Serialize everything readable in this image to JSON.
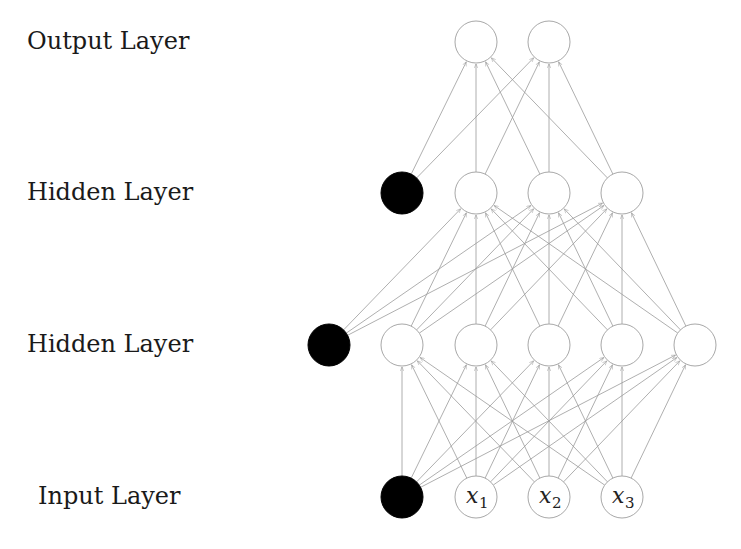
{
  "labels": {
    "output": "Output Layer",
    "hidden2": "Hidden Layer",
    "hidden1": "Hidden Layer",
    "input": "Input Layer"
  },
  "colors": {
    "edge": "#9a9a9a",
    "node_stroke": "#a8a8a8",
    "node_fill": "#ffffff",
    "bias_fill": "#000000",
    "text": "#1a1a1a"
  },
  "network": {
    "node_radius": 21,
    "layers": [
      {
        "name": "input",
        "y": 497,
        "nodes": [
          {
            "id": "in-bias",
            "x": 402,
            "bias": true,
            "label": "",
            "sub": ""
          },
          {
            "id": "x1",
            "x": 476,
            "bias": false,
            "label": "x",
            "sub": "1"
          },
          {
            "id": "x2",
            "x": 549,
            "bias": false,
            "label": "x",
            "sub": "2"
          },
          {
            "id": "x3",
            "x": 622,
            "bias": false,
            "label": "x",
            "sub": "3"
          }
        ]
      },
      {
        "name": "hidden1",
        "y": 345,
        "nodes": [
          {
            "id": "h1-bias",
            "x": 329,
            "bias": true,
            "label": "",
            "sub": ""
          },
          {
            "id": "h1-1",
            "x": 402,
            "bias": false,
            "label": "",
            "sub": ""
          },
          {
            "id": "h1-2",
            "x": 476,
            "bias": false,
            "label": "",
            "sub": ""
          },
          {
            "id": "h1-3",
            "x": 549,
            "bias": false,
            "label": "",
            "sub": ""
          },
          {
            "id": "h1-4",
            "x": 622,
            "bias": false,
            "label": "",
            "sub": ""
          },
          {
            "id": "h1-5",
            "x": 695,
            "bias": false,
            "label": "",
            "sub": ""
          }
        ]
      },
      {
        "name": "hidden2",
        "y": 193,
        "nodes": [
          {
            "id": "h2-bias",
            "x": 402,
            "bias": true,
            "label": "",
            "sub": ""
          },
          {
            "id": "h2-1",
            "x": 476,
            "bias": false,
            "label": "",
            "sub": ""
          },
          {
            "id": "h2-2",
            "x": 549,
            "bias": false,
            "label": "",
            "sub": ""
          },
          {
            "id": "h2-3",
            "x": 622,
            "bias": false,
            "label": "",
            "sub": ""
          }
        ]
      },
      {
        "name": "output",
        "y": 42,
        "nodes": [
          {
            "id": "o-1",
            "x": 476,
            "bias": false,
            "label": "",
            "sub": ""
          },
          {
            "id": "o-2",
            "x": 549,
            "bias": false,
            "label": "",
            "sub": ""
          }
        ]
      }
    ]
  }
}
